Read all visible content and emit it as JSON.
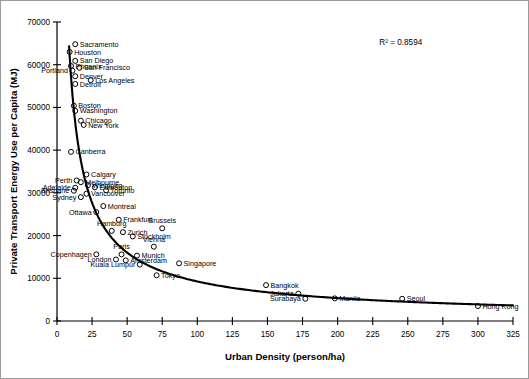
{
  "chart_data": {
    "type": "scatter",
    "title": "",
    "xlabel": "Urban Density (person/ha)",
    "ylabel": "Private Transport Energy Use per Capita (MJ)",
    "xlim": [
      0,
      325
    ],
    "ylim": [
      0,
      70000
    ],
    "xticks": [
      0,
      25,
      50,
      75,
      100,
      125,
      150,
      175,
      200,
      225,
      250,
      275,
      300,
      325
    ],
    "yticks": [
      0,
      10000,
      20000,
      30000,
      40000,
      50000,
      60000,
      70000
    ],
    "grid": false,
    "legend": null,
    "annotations": [
      {
        "text": "R² = 0.8594",
        "x": 245,
        "y": 64500
      }
    ],
    "trendline": {
      "present": true,
      "type": "power-law",
      "r_squared": 0.8594
    },
    "marker": "open-circle",
    "points": [
      {
        "label": "Sacramento",
        "x": 13,
        "y": 64800,
        "label_pos": "right"
      },
      {
        "label": "Houston",
        "x": 9,
        "y": 63000,
        "label_pos": "right"
      },
      {
        "label": "San Diego",
        "x": 13,
        "y": 60900,
        "label_pos": "right"
      },
      {
        "label": "Phoenix",
        "x": 10,
        "y": 59700,
        "label_pos": "right"
      },
      {
        "label": "San Francisco",
        "x": 16,
        "y": 59300,
        "label_pos": "right"
      },
      {
        "label": "Portland",
        "x": 11,
        "y": 58600,
        "label_pos": "left"
      },
      {
        "label": "Denver",
        "x": 13,
        "y": 57300,
        "label_pos": "right"
      },
      {
        "label": "Los Angeles",
        "x": 24,
        "y": 56400,
        "label_pos": "right"
      },
      {
        "label": "Detroit",
        "x": 13,
        "y": 55500,
        "label_pos": "right"
      },
      {
        "label": "Boston",
        "x": 12,
        "y": 50400,
        "label_pos": "right"
      },
      {
        "label": "Washington",
        "x": 13,
        "y": 49200,
        "label_pos": "right"
      },
      {
        "label": "Chicago",
        "x": 17,
        "y": 46900,
        "label_pos": "right"
      },
      {
        "label": "New York",
        "x": 19,
        "y": 45900,
        "label_pos": "right"
      },
      {
        "label": "Canberra",
        "x": 10,
        "y": 39600,
        "label_pos": "right"
      },
      {
        "label": "Calgary",
        "x": 21,
        "y": 34300,
        "label_pos": "right"
      },
      {
        "label": "Perth",
        "x": 14,
        "y": 32900,
        "label_pos": "left"
      },
      {
        "label": "Melbourne",
        "x": 17,
        "y": 32500,
        "label_pos": "right"
      },
      {
        "label": "Winnipeg",
        "x": 22,
        "y": 31800,
        "label_pos": "right"
      },
      {
        "label": "Adelaide",
        "x": 13,
        "y": 31200,
        "label_pos": "left"
      },
      {
        "label": "Edmonton",
        "x": 27,
        "y": 31300,
        "label_pos": "right"
      },
      {
        "label": "Brisbane",
        "x": 12,
        "y": 30500,
        "label_pos": "left"
      },
      {
        "label": "Toronto",
        "x": 35,
        "y": 30600,
        "label_pos": "right"
      },
      {
        "label": "Vancouver",
        "x": 21,
        "y": 29800,
        "label_pos": "right"
      },
      {
        "label": "Sydney",
        "x": 17,
        "y": 29000,
        "label_pos": "left"
      },
      {
        "label": "Montreal",
        "x": 33,
        "y": 26900,
        "label_pos": "right"
      },
      {
        "label": "Ottawa",
        "x": 28,
        "y": 25500,
        "label_pos": "left"
      },
      {
        "label": "Frankfurt",
        "x": 44,
        "y": 23700,
        "label_pos": "right"
      },
      {
        "label": "Brussels",
        "x": 75,
        "y": 21700,
        "label_pos": "top"
      },
      {
        "label": "Hamburg",
        "x": 39,
        "y": 21100,
        "label_pos": "top"
      },
      {
        "label": "Zurich",
        "x": 47,
        "y": 20800,
        "label_pos": "right"
      },
      {
        "label": "Stockholm",
        "x": 54,
        "y": 19800,
        "label_pos": "right"
      },
      {
        "label": "Vienna",
        "x": 69,
        "y": 17400,
        "label_pos": "top"
      },
      {
        "label": "Copenhagen",
        "x": 28,
        "y": 15600,
        "label_pos": "left"
      },
      {
        "label": "Paris",
        "x": 46,
        "y": 15600,
        "label_pos": "top"
      },
      {
        "label": "Munich",
        "x": 57,
        "y": 15300,
        "label_pos": "right"
      },
      {
        "label": "London",
        "x": 42,
        "y": 14400,
        "label_pos": "left"
      },
      {
        "label": "Amsterdam",
        "x": 49,
        "y": 14200,
        "label_pos": "right"
      },
      {
        "label": "Kuala Lumpur",
        "x": 59,
        "y": 13200,
        "label_pos": "left"
      },
      {
        "label": "Singapore",
        "x": 87,
        "y": 13500,
        "label_pos": "right"
      },
      {
        "label": "Tokyo",
        "x": 71,
        "y": 10700,
        "label_pos": "right"
      },
      {
        "label": "Bangkok",
        "x": 149,
        "y": 8400,
        "label_pos": "right"
      },
      {
        "label": "Jakarta",
        "x": 172,
        "y": 6400,
        "label_pos": "left"
      },
      {
        "label": "Surabaya",
        "x": 177,
        "y": 5200,
        "label_pos": "left"
      },
      {
        "label": "Manila",
        "x": 198,
        "y": 5300,
        "label_pos": "right"
      },
      {
        "label": "Seoul",
        "x": 246,
        "y": 5200,
        "label_pos": "right"
      },
      {
        "label": "Hong Kong",
        "x": 300,
        "y": 3500,
        "label_pos": "right"
      }
    ]
  }
}
